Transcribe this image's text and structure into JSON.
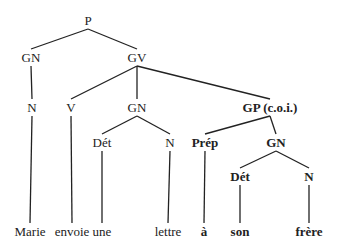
{
  "tree": {
    "nodes": [
      {
        "id": "P",
        "label": "P",
        "bold": false
      },
      {
        "id": "GN1",
        "label": "GN",
        "bold": false
      },
      {
        "id": "GV",
        "label": "GV",
        "bold": false
      },
      {
        "id": "N1",
        "label": "N",
        "bold": false
      },
      {
        "id": "V",
        "label": "V",
        "bold": false
      },
      {
        "id": "GN2",
        "label": "GN",
        "bold": false
      },
      {
        "id": "GP",
        "label": "GP (c.o.i.)",
        "bold": true
      },
      {
        "id": "Det1",
        "label": "Dét",
        "bold": false
      },
      {
        "id": "N2",
        "label": "N",
        "bold": false
      },
      {
        "id": "Prep",
        "label": "Prép",
        "bold": true
      },
      {
        "id": "GN3",
        "label": "GN",
        "bold": true
      },
      {
        "id": "Det2",
        "label": "Dét",
        "bold": true
      },
      {
        "id": "N3",
        "label": "N",
        "bold": true
      },
      {
        "id": "w1",
        "label": "Marie",
        "bold": false
      },
      {
        "id": "w2",
        "label": "envoie",
        "bold": false
      },
      {
        "id": "w3",
        "label": "une",
        "bold": false
      },
      {
        "id": "w4",
        "label": "lettre",
        "bold": false
      },
      {
        "id": "w5",
        "label": "à",
        "bold": true
      },
      {
        "id": "w6",
        "label": "son",
        "bold": true
      },
      {
        "id": "w7",
        "label": "frère",
        "bold": true
      }
    ],
    "edges": [
      [
        "P",
        "GN1"
      ],
      [
        "P",
        "GV"
      ],
      [
        "GN1",
        "N1"
      ],
      [
        "GV",
        "V"
      ],
      [
        "GV",
        "GN2"
      ],
      [
        "GV",
        "GP"
      ],
      [
        "N1",
        "w1"
      ],
      [
        "V",
        "w2"
      ],
      [
        "GN2",
        "Det1"
      ],
      [
        "GN2",
        "N2"
      ],
      [
        "Det1",
        "w3"
      ],
      [
        "N2",
        "w4"
      ],
      [
        "GP",
        "Prep"
      ],
      [
        "GP",
        "GN3"
      ],
      [
        "Prep",
        "w5"
      ],
      [
        "GN3",
        "Det2"
      ],
      [
        "GN3",
        "N3"
      ],
      [
        "Det2",
        "w6"
      ],
      [
        "N3",
        "w7"
      ]
    ]
  }
}
